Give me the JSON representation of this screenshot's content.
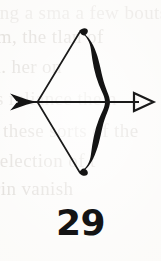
{
  "page": {
    "background_color": "#fbfaf8",
    "ink_color": "#111111",
    "ghost_text_color": "#cfcac4"
  },
  "illustration": {
    "name": "bow-and-arrow",
    "description": "Line drawing of a drawn recurve bow with a nocked arrow pointing right",
    "parts": [
      {
        "name": "bow-limb",
        "style": "thick solid black recurve"
      },
      {
        "name": "bow-string",
        "style": "thin black line forming a leftward triangle"
      },
      {
        "name": "arrow-shaft",
        "style": "thin horizontal black line"
      },
      {
        "name": "arrow-fletching",
        "style": "solid black barbed feathers"
      },
      {
        "name": "arrow-head",
        "style": "open triangle outline"
      }
    ]
  },
  "figure": {
    "number": "29"
  },
  "ghost_text": {
    "lines": [
      "ing a sma a few bouts",
      "rm, the tlan of",
      "m. her on",
      "s reliance the n",
      "g these sorts of the",
      "selection of t",
      "rin  vanish"
    ]
  }
}
